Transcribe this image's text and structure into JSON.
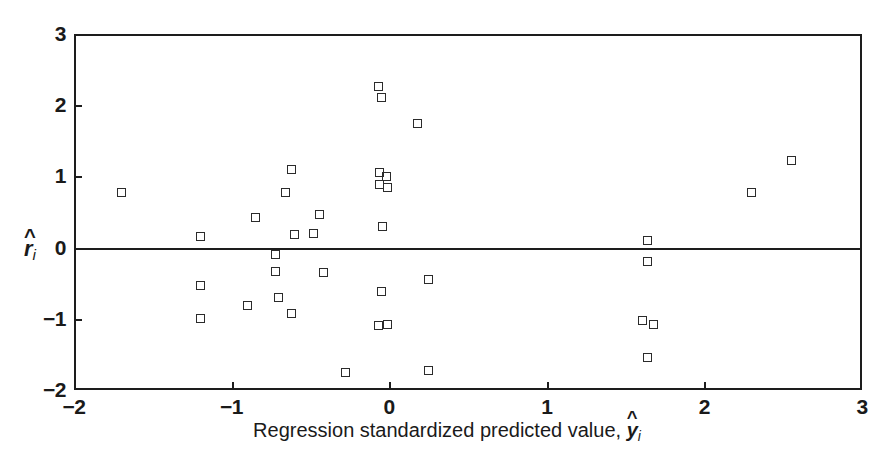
{
  "chart_data": {
    "type": "scatter",
    "title": "",
    "xlabel": "Regression standardized predicted value, ŷi",
    "ylabel": "r̂i",
    "xlim": [
      -2,
      3
    ],
    "ylim": [
      -2,
      3
    ],
    "xticks": [
      -2,
      -1,
      0,
      1,
      2,
      3
    ],
    "xticklabels": [
      "−2",
      "−1",
      "0",
      "1",
      "2",
      "3"
    ],
    "yticks": [
      -2,
      -1,
      0,
      1,
      2,
      3
    ],
    "yticklabels": [
      "−2",
      "−1",
      "0",
      "1",
      "2",
      "3"
    ],
    "grid": false,
    "legend": null,
    "marker": "open-square",
    "marker_color": "#2b2b2b",
    "reference_lines": [
      {
        "axis": "y",
        "value": 0,
        "style": "solid"
      }
    ],
    "n_points": 40,
    "points": [
      {
        "x": -1.7,
        "y": 0.78
      },
      {
        "x": -1.2,
        "y": 0.15
      },
      {
        "x": -1.2,
        "y": -0.53
      },
      {
        "x": -1.2,
        "y": -1.0
      },
      {
        "x": -0.9,
        "y": -0.82
      },
      {
        "x": -0.85,
        "y": 0.42
      },
      {
        "x": -0.72,
        "y": -0.1
      },
      {
        "x": -0.72,
        "y": -0.33
      },
      {
        "x": -0.7,
        "y": -0.7
      },
      {
        "x": -0.66,
        "y": 0.78
      },
      {
        "x": -0.62,
        "y": -0.92
      },
      {
        "x": -0.62,
        "y": 1.1
      },
      {
        "x": -0.6,
        "y": 0.18
      },
      {
        "x": -0.48,
        "y": 0.2
      },
      {
        "x": -0.44,
        "y": 0.47
      },
      {
        "x": -0.42,
        "y": -0.35
      },
      {
        "x": -0.28,
        "y": -1.75
      },
      {
        "x": -0.07,
        "y": 2.26
      },
      {
        "x": -0.05,
        "y": 2.11
      },
      {
        "x": -0.06,
        "y": 1.05
      },
      {
        "x": -0.02,
        "y": 1.0
      },
      {
        "x": -0.06,
        "y": 0.88
      },
      {
        "x": -0.01,
        "y": 0.84
      },
      {
        "x": -0.04,
        "y": 0.3
      },
      {
        "x": -0.05,
        "y": -0.62
      },
      {
        "x": -0.07,
        "y": -1.1
      },
      {
        "x": -0.01,
        "y": -1.08
      },
      {
        "x": 0.18,
        "y": 1.75
      },
      {
        "x": 0.25,
        "y": -0.45
      },
      {
        "x": 0.25,
        "y": -1.72
      },
      {
        "x": 1.64,
        "y": 0.1
      },
      {
        "x": 1.64,
        "y": -0.2
      },
      {
        "x": 1.61,
        "y": -1.02
      },
      {
        "x": 1.68,
        "y": -1.08
      },
      {
        "x": 1.64,
        "y": -1.55
      },
      {
        "x": 2.3,
        "y": 0.78
      },
      {
        "x": 2.55,
        "y": 1.22
      }
    ]
  },
  "figure": {
    "plot_left_px": 74,
    "plot_top_px": 34,
    "plot_width_px": 788,
    "plot_height_px": 356
  }
}
